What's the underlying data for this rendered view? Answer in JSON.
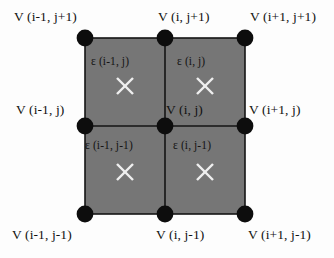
{
  "diagram": {
    "type": "finite-difference-grid-stencil",
    "background_color": "#fdfdfd",
    "cell_fill_color": "#767676",
    "node_color": "#0d0d0d",
    "grid_line_color": "#151515",
    "marker_color": "#efefef",
    "nodes": [
      {
        "id": "node-top-left",
        "label": "V (i-1, j+1)",
        "cx": 85,
        "cy": 38
      },
      {
        "id": "node-top-center",
        "label": "V (i, j+1)",
        "cx": 165,
        "cy": 38
      },
      {
        "id": "node-top-right",
        "label": "V (i+1, j+1)",
        "cx": 245,
        "cy": 38
      },
      {
        "id": "node-middle-left",
        "label": "V (i-1, j)",
        "cx": 85,
        "cy": 126
      },
      {
        "id": "node-middle-center",
        "label": "V (i, j)",
        "cx": 165,
        "cy": 126
      },
      {
        "id": "node-middle-right",
        "label": "V (i+1, j)",
        "cx": 245,
        "cy": 126
      },
      {
        "id": "node-bottom-left",
        "label": "V (i-1, j-1)",
        "cx": 85,
        "cy": 214
      },
      {
        "id": "node-bottom-center",
        "label": "V (i, j-1)",
        "cx": 165,
        "cy": 214
      },
      {
        "id": "node-bottom-right",
        "label": "V (i+1, j-1)",
        "cx": 245,
        "cy": 214
      }
    ],
    "cells": [
      {
        "id": "cell-top-left",
        "label": "ε (i-1, j)",
        "marker": "x-marker",
        "mx": 125,
        "my": 86
      },
      {
        "id": "cell-top-right",
        "label": "ε (i, j)",
        "marker": "x-marker",
        "mx": 205,
        "my": 86
      },
      {
        "id": "cell-bottom-left",
        "label": "ε (i-1, j-1)",
        "marker": "x-marker",
        "mx": 125,
        "my": 172
      },
      {
        "id": "cell-bottom-right",
        "label": "ε (i, j-1)",
        "marker": "x-marker",
        "mx": 205,
        "my": 172
      }
    ]
  }
}
